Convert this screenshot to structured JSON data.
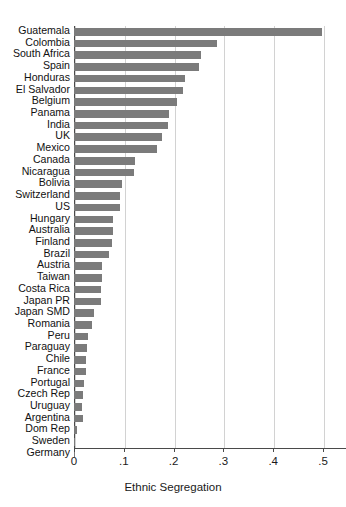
{
  "chart_data": {
    "type": "bar",
    "orientation": "horizontal",
    "title": "",
    "xlabel": "Ethnic Segregation",
    "ylabel": "",
    "xlim": [
      0,
      0.55
    ],
    "xticks": [
      0,
      0.1,
      0.2,
      0.3,
      0.4,
      0.5
    ],
    "xtick_labels": [
      "0",
      ".1",
      ".2",
      ".3",
      ".4",
      ".5"
    ],
    "grid": "vertical",
    "legend": "none",
    "bar_color": "#7b7b7b",
    "categories": [
      "Guatemala",
      "Colombia",
      "South Africa",
      "Spain",
      "Honduras",
      "El Salvador",
      "Belgium",
      "Panama",
      "India",
      "UK",
      "Mexico",
      "Canada",
      "Nicaragua",
      "Bolivia",
      "Switzerland",
      "US",
      "Hungary",
      "Australia",
      "Finland",
      "Brazil",
      "Austria",
      "Taiwan",
      "Costa Rica",
      "Japan PR",
      "Japan  SMD",
      "Romania",
      "Peru",
      "Paraguay",
      "Chile",
      "France",
      "Portugal",
      "Czech Rep",
      "Uruguay",
      "Argentina",
      "Dom Rep",
      "Sweden",
      "Germany"
    ],
    "values": [
      0.498,
      0.287,
      0.255,
      0.252,
      0.223,
      0.218,
      0.206,
      0.19,
      0.188,
      0.177,
      0.167,
      0.122,
      0.12,
      0.097,
      0.092,
      0.092,
      0.079,
      0.078,
      0.077,
      0.07,
      0.057,
      0.056,
      0.055,
      0.054,
      0.04,
      0.037,
      0.029,
      0.027,
      0.025,
      0.024,
      0.02,
      0.018,
      0.017,
      0.019,
      0.006,
      0.001,
      0.001
    ]
  }
}
